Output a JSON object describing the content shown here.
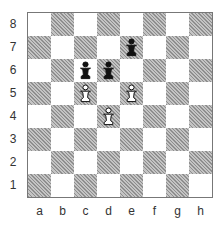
{
  "diagram": {
    "type": "chess-position",
    "orientation": "white-bottom",
    "colors": {
      "light_square": "#ffffff",
      "dark_square": "#a9a9a9",
      "border": "#777777"
    },
    "ranks": [
      "8",
      "7",
      "6",
      "5",
      "4",
      "3",
      "2",
      "1"
    ],
    "files": [
      "a",
      "b",
      "c",
      "d",
      "e",
      "f",
      "g",
      "h"
    ],
    "pieces": [
      {
        "square": "e7",
        "color": "black",
        "type": "pawn"
      },
      {
        "square": "c6",
        "color": "black",
        "type": "pawn"
      },
      {
        "square": "d6",
        "color": "black",
        "type": "pawn"
      },
      {
        "square": "c5",
        "color": "white",
        "type": "pawn"
      },
      {
        "square": "e5",
        "color": "white",
        "type": "pawn"
      },
      {
        "square": "d4",
        "color": "white",
        "type": "pawn"
      }
    ]
  }
}
